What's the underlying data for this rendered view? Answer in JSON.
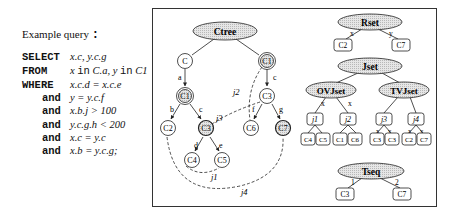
{
  "query": {
    "title": "Example query ",
    "title_colon": ":",
    "lines": [
      {
        "keyword": "SELECT",
        "expr": "x.c, y.c.g"
      },
      {
        "keyword": "FROM",
        "expr_parts": [
          "x ",
          "in",
          " C.a, y ",
          "in",
          " C1"
        ]
      },
      {
        "keyword": "WHERE",
        "expr": "x.c.d = x.c.e"
      },
      {
        "keyword": "and",
        "expr": "y = y.c.f"
      },
      {
        "keyword": "and",
        "expr": "x.b.j > 100"
      },
      {
        "keyword": "and",
        "expr": "y.c.g.h < 200"
      },
      {
        "keyword": "and",
        "expr": "x.c = y.c"
      },
      {
        "keyword": "and",
        "expr": "x.b = y.c.g;"
      }
    ]
  },
  "colors": {
    "frame": "#333333",
    "ellipse_fill": "#d9d9d9",
    "shaded_node_fill": "#cfcfcf",
    "stroke": "#222222"
  },
  "ctree": {
    "root": "Ctree",
    "nodes": {
      "c": "C",
      "c1_left": "C1",
      "c1_right": "C1",
      "c3_right": "C3",
      "c2": "C2",
      "c3_shaded": "C3",
      "c6": "C6",
      "c7": "C7",
      "c4": "C4",
      "c5": "C5"
    },
    "edge_labels": {
      "a": "a",
      "c_left": "c",
      "c_right": "c",
      "b": "b",
      "d": "d",
      "e": "e",
      "f": "f",
      "g": "g"
    },
    "join_labels": {
      "j1": "j1",
      "j2": "j2",
      "j3": "j3",
      "j4": "j4"
    }
  },
  "rset": {
    "root": "Rset",
    "left_label": "x",
    "right_label": "y",
    "left": "C2",
    "right": "C7"
  },
  "jset": {
    "root": "Jset",
    "ovjset": {
      "label": "OVJset",
      "edge_labels": [
        "x",
        "x"
      ],
      "children": [
        {
          "label": "j1",
          "leaves": [
            "C4",
            "C5"
          ]
        },
        {
          "label": "j2",
          "leaves": [
            "C1",
            "C6"
          ]
        }
      ]
    },
    "tvjset": {
      "label": "TVJset",
      "children": [
        {
          "label": "j3",
          "edge_labels": [
            "x",
            "y"
          ],
          "leaves": [
            "C3",
            "C3"
          ]
        },
        {
          "label": "j4",
          "edge_labels": [
            "x",
            "y"
          ],
          "leaves": [
            "C2",
            "C7"
          ]
        }
      ]
    }
  },
  "tseq": {
    "root": "Tseq",
    "left_label": "1",
    "right_label": "2",
    "left": "C3",
    "right": "C7"
  }
}
